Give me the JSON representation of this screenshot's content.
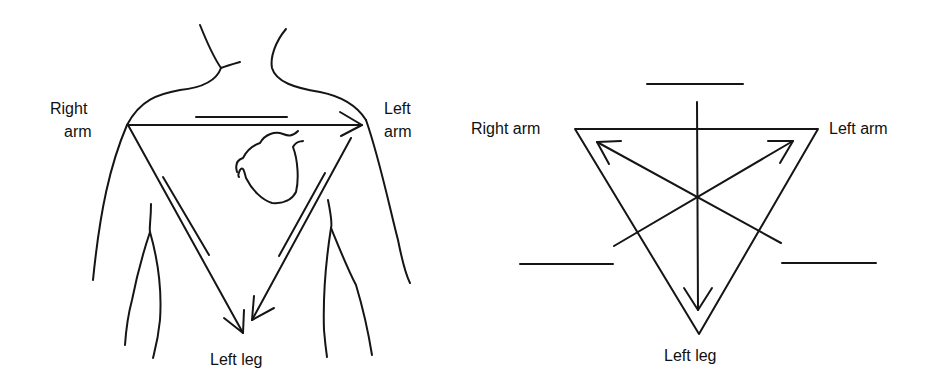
{
  "diagram": {
    "ink_color": "#151515",
    "background": "#ffffff",
    "left_panel": {
      "description": "Einthoven triangle drawn over torso with heart",
      "labels": {
        "right_arm_line1": "Right",
        "right_arm_line2": "arm",
        "left_arm_line1": "Left",
        "left_arm_line2": "arm",
        "left_leg": "Left leg"
      },
      "elements": [
        "torso-outline",
        "heart",
        "triangle-lead-vectors",
        "lead-polarity-bars"
      ]
    },
    "right_panel": {
      "description": "Equilateral triangle with three lead axes through centre and blank label lines",
      "labels": {
        "right_arm": "Right arm",
        "left_arm": "Left arm",
        "left_leg": "Left leg"
      },
      "blank_lines": 3,
      "axes": [
        "vertical-down-arrow",
        "to-left-arm-arrow",
        "to-right-arm-arrow"
      ]
    }
  }
}
